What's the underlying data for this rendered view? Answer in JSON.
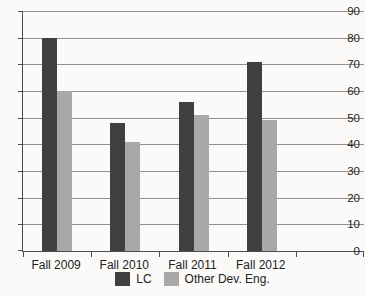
{
  "figure": {
    "background_color": "#fbfaf8",
    "text_color": "#222220",
    "gridline_color": "#909090",
    "axis_color": "#4d4d4d"
  },
  "chart_data": {
    "type": "bar",
    "title": "",
    "categories": [
      "Fall 2009",
      "Fall 2010",
      "Fall 2011",
      "Fall 2012",
      ""
    ],
    "series": [
      {
        "name": "LC",
        "color": "#413f42",
        "values": [
          80,
          48,
          56,
          71,
          null
        ]
      },
      {
        "name": "Other Dev. Eng.",
        "color": "#a8a8a8",
        "values": [
          60,
          41,
          51,
          49,
          null
        ]
      }
    ],
    "xlabel": "",
    "ylabel": "",
    "ylim": [
      0,
      90
    ],
    "yticks": [
      0,
      10,
      20,
      30,
      40,
      50,
      60,
      70,
      80,
      90
    ],
    "grid": true,
    "legend_position": "bottom",
    "bar_width_px": 15
  }
}
